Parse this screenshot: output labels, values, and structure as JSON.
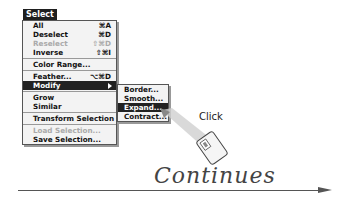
{
  "menu": {
    "title": "Select",
    "items": [
      {
        "label": "All",
        "shortcut": "⌘A",
        "disabled": false
      },
      {
        "label": "Deselect",
        "shortcut": "⌘D",
        "disabled": false
      },
      {
        "label": "Reselect",
        "shortcut": "⇧⌘D",
        "disabled": true
      },
      {
        "label": "Inverse",
        "shortcut": "⇧⌘I",
        "disabled": false
      },
      {
        "label": "Color Range...",
        "shortcut": "",
        "disabled": false
      },
      {
        "label": "Feather...",
        "shortcut": "⌥⌘D",
        "disabled": false
      },
      {
        "label": "Modify",
        "shortcut": "",
        "disabled": false,
        "highlighted": true,
        "submenu": true
      },
      {
        "label": "Grow",
        "shortcut": "",
        "disabled": false
      },
      {
        "label": "Similar",
        "shortcut": "",
        "disabled": false
      },
      {
        "label": "Transform Selection",
        "shortcut": "",
        "disabled": false
      },
      {
        "label": "Load Selection...",
        "shortcut": "",
        "disabled": true
      },
      {
        "label": "Save Selection...",
        "shortcut": "",
        "disabled": false
      }
    ]
  },
  "submenu": {
    "items": [
      {
        "label": "Border..."
      },
      {
        "label": "Smooth..."
      },
      {
        "label": "Expand...",
        "highlighted": true
      },
      {
        "label": "Contract..."
      }
    ]
  },
  "annotation": {
    "click_label": "Click",
    "icon": "mouse-icon"
  },
  "footer": {
    "continues_label": "Continues"
  }
}
